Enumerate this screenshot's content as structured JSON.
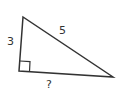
{
  "diagram": {
    "type": "right-triangle",
    "labels": {
      "vertical_leg": "3",
      "hypotenuse": "5",
      "horizontal_leg": "?"
    },
    "right_angle_marker": true,
    "colors": {
      "stroke": "#333333",
      "background": "#ffffff"
    }
  }
}
